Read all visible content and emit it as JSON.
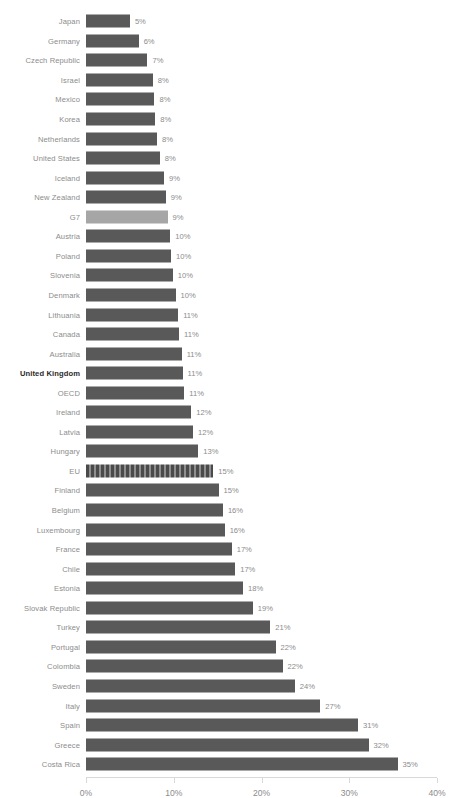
{
  "chart_data": {
    "type": "bar",
    "orientation": "horizontal",
    "title": "",
    "xlabel": "",
    "ylabel": "",
    "xlim": [
      0,
      40
    ],
    "xticks": [
      "0%",
      "10%",
      "20%",
      "30%",
      "40%"
    ],
    "xtick_values": [
      0,
      10,
      20,
      30,
      40
    ],
    "grid": false,
    "legend": "none",
    "value_suffix": "%",
    "colors": {
      "bar": "#595959",
      "bar_light": "#a6a6a6",
      "bar_hatch_dark": "#4a4a4a",
      "bar_hatch_light": "#8f8f8f",
      "label": "#8c8c8c",
      "label_highlight": "#2b2b2b",
      "axis": "#d9d9d9",
      "background": "#ffffff"
    },
    "categories": [
      "Japan",
      "Germany",
      "Czech Republic",
      "Israel",
      "Mexico",
      "Korea",
      "Netherlands",
      "United States",
      "Iceland",
      "New Zealand",
      "G7",
      "Austria",
      "Poland",
      "Slovenia",
      "Denmark",
      "Lithuania",
      "Canada",
      "Australia",
      "United Kingdom",
      "OECD",
      "Ireland",
      "Latvia",
      "Hungary",
      "EU",
      "Finland",
      "Belgium",
      "Luxembourg",
      "France",
      "Chile",
      "Estonia",
      "Slovak Republic",
      "Turkey",
      "Portugal",
      "Colombia",
      "Sweden",
      "Italy",
      "Spain",
      "Greece",
      "Costa Rica"
    ],
    "values": [
      5,
      6,
      7,
      8,
      8,
      8,
      8,
      8,
      9,
      9,
      9,
      10,
      10,
      10,
      10,
      11,
      11,
      11,
      11,
      11,
      12,
      12,
      13,
      15,
      15,
      16,
      16,
      17,
      17,
      18,
      19,
      21,
      22,
      22,
      24,
      27,
      31,
      32,
      35
    ],
    "labels": [
      "5%",
      "6%",
      "7%",
      "8%",
      "8%",
      "8%",
      "8%",
      "8%",
      "9%",
      "9%",
      "9%",
      "10%",
      "10%",
      "10%",
      "10%",
      "11%",
      "11%",
      "11%",
      "11%",
      "11%",
      "12%",
      "12%",
      "13%",
      "15%",
      "15%",
      "16%",
      "16%",
      "17%",
      "17%",
      "18%",
      "19%",
      "21%",
      "22%",
      "22%",
      "24%",
      "27%",
      "31%",
      "32%",
      "35%"
    ],
    "bar_widths_pct": [
      5.0,
      6.0,
      7.0,
      7.6,
      7.8,
      7.9,
      8.1,
      8.4,
      8.9,
      9.1,
      9.3,
      9.6,
      9.7,
      9.9,
      10.2,
      10.5,
      10.6,
      10.9,
      11.0,
      11.2,
      12.0,
      12.2,
      12.8,
      14.5,
      15.1,
      15.6,
      15.8,
      16.6,
      17.0,
      17.9,
      19.0,
      21.0,
      21.6,
      22.4,
      23.8,
      26.7,
      31.0,
      32.2,
      35.5
    ],
    "styles": [
      "solid",
      "solid",
      "solid",
      "solid",
      "solid",
      "solid",
      "solid",
      "solid",
      "solid",
      "solid",
      "light",
      "solid",
      "solid",
      "solid",
      "solid",
      "solid",
      "solid",
      "solid",
      "solid",
      "solid",
      "solid",
      "solid",
      "solid",
      "hatch",
      "solid",
      "solid",
      "solid",
      "solid",
      "solid",
      "solid",
      "solid",
      "solid",
      "solid",
      "solid",
      "solid",
      "solid",
      "solid",
      "solid",
      "solid"
    ],
    "highlighted_category": "United Kingdom"
  }
}
